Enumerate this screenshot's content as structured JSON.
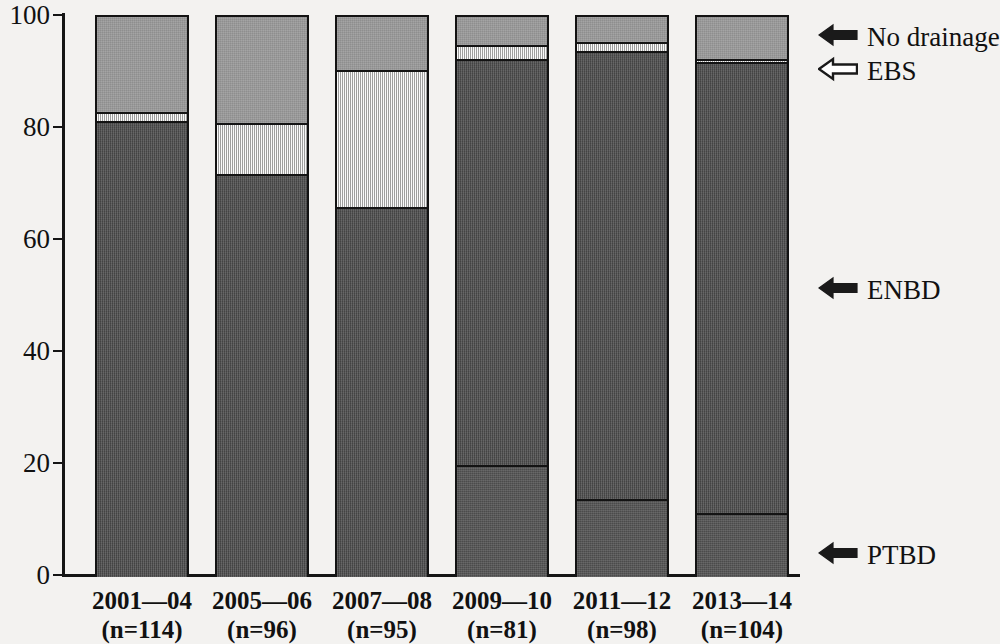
{
  "chart_data": {
    "type": "bar",
    "title": "",
    "subtitle": "",
    "xlabel": "",
    "ylabel": "",
    "ylim": [
      0,
      100
    ],
    "yticks": [
      0,
      20,
      40,
      60,
      80,
      100
    ],
    "ytick_labels": [
      "0",
      "20",
      "40",
      "60",
      "80",
      "100"
    ],
    "grid": false,
    "stacked": true,
    "legend_position": "right-callouts",
    "categories": [
      "2001—04",
      "2005—06",
      "2007—08",
      "2009—10",
      "2011—12",
      "2013—14"
    ],
    "category_sublabels": [
      "(n=114)",
      "(n=96)",
      "(n=95)",
      "(n=81)",
      "(n=98)",
      "(n=104)"
    ],
    "sample_sizes": [
      114,
      96,
      95,
      81,
      98,
      104
    ],
    "series": [
      {
        "name": "PTBD",
        "color": "#545454",
        "values": [
          0,
          0,
          0,
          20,
          14,
          11.5
        ]
      },
      {
        "name": "ENBD",
        "color": "#4f4f4f",
        "values": [
          81.5,
          72,
          66,
          72.5,
          80,
          80.5
        ]
      },
      {
        "name": "EBS",
        "color": "#d9d9d6",
        "values": [
          1.5,
          9,
          24.5,
          2.5,
          1.5,
          0.5
        ]
      },
      {
        "name": "No drainage",
        "color": "#9a9a9a",
        "values": [
          17,
          19,
          9.5,
          5,
          4.5,
          7.5
        ]
      }
    ],
    "annotations": [
      {
        "label": "No drainage",
        "arrow": "solid-left-arrow",
        "target_series": "No drainage"
      },
      {
        "label": "EBS",
        "arrow": "outline-left-arrow",
        "target_series": "EBS"
      },
      {
        "label": "ENBD",
        "arrow": "solid-left-arrow",
        "target_series": "ENBD"
      },
      {
        "label": "PTBD",
        "arrow": "solid-left-arrow",
        "target_series": "PTBD"
      }
    ]
  },
  "axis": {
    "y_ticks": [
      {
        "label": "100",
        "value": 100
      },
      {
        "label": "80",
        "value": 80
      },
      {
        "label": "60",
        "value": 60
      },
      {
        "label": "40",
        "value": 40
      },
      {
        "label": "20",
        "value": 20
      },
      {
        "label": "0",
        "value": 0
      }
    ]
  },
  "bars": [
    {
      "category": "2001—04",
      "n_label": "(n=114)",
      "segments": [
        {
          "series": "ENBD",
          "value": 81.5
        },
        {
          "series": "EBS",
          "value": 1.5
        },
        {
          "series": "No drainage",
          "value": 17
        }
      ]
    },
    {
      "category": "2005—06",
      "n_label": "(n=96)",
      "segments": [
        {
          "series": "ENBD",
          "value": 72
        },
        {
          "series": "EBS",
          "value": 9
        },
        {
          "series": "No drainage",
          "value": 19
        }
      ]
    },
    {
      "category": "2007—08",
      "n_label": "(n=95)",
      "segments": [
        {
          "series": "ENBD",
          "value": 66
        },
        {
          "series": "EBS",
          "value": 24.5
        },
        {
          "series": "No drainage",
          "value": 9.5
        }
      ]
    },
    {
      "category": "2009—10",
      "n_label": "(n=81)",
      "segments": [
        {
          "series": "PTBD",
          "value": 20
        },
        {
          "series": "ENBD",
          "value": 72.5
        },
        {
          "series": "EBS",
          "value": 2.5
        },
        {
          "series": "No drainage",
          "value": 5
        }
      ]
    },
    {
      "category": "2011—12",
      "n_label": "(n=98)",
      "segments": [
        {
          "series": "PTBD",
          "value": 14
        },
        {
          "series": "ENBD",
          "value": 80
        },
        {
          "series": "EBS",
          "value": 1.5
        },
        {
          "series": "No drainage",
          "value": 4.5
        }
      ]
    },
    {
      "category": "2013—14",
      "n_label": "(n=104)",
      "segments": [
        {
          "series": "PTBD",
          "value": 11.5
        },
        {
          "series": "ENBD",
          "value": 80.5
        },
        {
          "series": "EBS",
          "value": 0.5
        },
        {
          "series": "No drainage",
          "value": 7.5
        }
      ]
    }
  ],
  "callouts": [
    {
      "label": "No drainage",
      "style": "solid"
    },
    {
      "label": "EBS",
      "style": "outline"
    },
    {
      "label": "ENBD",
      "style": "solid"
    },
    {
      "label": "PTBD",
      "style": "solid"
    }
  ],
  "colors": {
    "ptbd": "#545454",
    "enbd": "#4f4f4f",
    "ebs": "#d9d9d6",
    "no_drainage": "#9a9a9a",
    "ink": "#131313",
    "paper": "#f3f2f0"
  }
}
